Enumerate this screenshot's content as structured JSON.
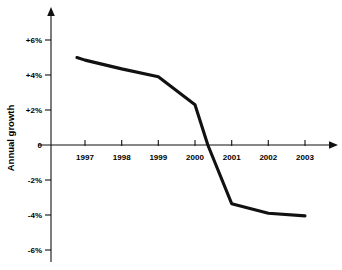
{
  "chart_data": {
    "type": "line",
    "title": "",
    "subtitle": "",
    "xlabel": "",
    "ylabel": "Annual growth",
    "x": [
      1997,
      1998,
      1999,
      2000,
      2001,
      2002,
      2003
    ],
    "categories": [
      "1997",
      "1998",
      "1999",
      "2000",
      "2001",
      "2002",
      "2003"
    ],
    "values": [
      4.8,
      4.4,
      3.9,
      2.3,
      -3.35,
      -3.9,
      -4.05
    ],
    "series": [
      {
        "name": "Annual growth",
        "values": [
          4.8,
          4.4,
          3.9,
          2.3,
          -3.35,
          -3.9,
          -4.05
        ]
      }
    ],
    "line_points": [
      {
        "x": 1996.78,
        "y": 5.0
      },
      {
        "x": 1997.0,
        "y": 4.85
      },
      {
        "x": 1998.0,
        "y": 4.35
      },
      {
        "x": 1999.0,
        "y": 3.9
      },
      {
        "x": 2000.0,
        "y": 2.3
      },
      {
        "x": 2000.35,
        "y": 0.0
      },
      {
        "x": 2001.0,
        "y": -3.35
      },
      {
        "x": 2002.0,
        "y": -3.9
      },
      {
        "x": 2003.0,
        "y": -4.05
      }
    ],
    "zero_crossing": "2000.35",
    "xlim": [
      1996.5,
      2003.8
    ],
    "ylim": [
      -6.6,
      6.6
    ],
    "ytick_values": [
      6,
      4,
      2,
      0,
      -2,
      -4,
      -6
    ],
    "ytick_labels": [
      "+6%",
      "+4%",
      "+2%",
      "0",
      "-2%",
      "-4%",
      "-6%"
    ],
    "xtick_labels": [
      "1997",
      "1998",
      "1999",
      "2000",
      "2001",
      "2002",
      "2003"
    ],
    "grid": false,
    "legend": "none",
    "line_color": "#111111",
    "axis_color": "#111111",
    "background_color": "#ffffff",
    "axis_arrows": {
      "y_axis": "up-arrow",
      "x_axis": "right-arrow"
    }
  }
}
